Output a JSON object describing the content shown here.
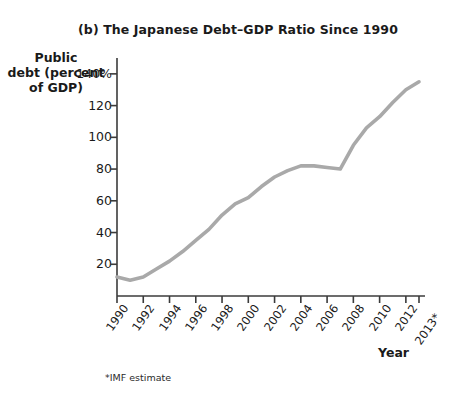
{
  "chart_data": {
    "type": "line",
    "title": "(b) The Japanese Debt–GDP Ratio Since 1990",
    "xlabel": "Year",
    "ylabel": "Public debt (percent of GDP)",
    "ylabel_lines": [
      "Public",
      "debt (percent",
      "of GDP)"
    ],
    "footnote": "*IMF estimate",
    "grid": false,
    "legend": "none",
    "line_color": "#a9a9a9",
    "axis_color": "#3b3b3b",
    "ylim": [
      0,
      150
    ],
    "xlim": [
      1990,
      2013
    ],
    "ytick_values": [
      140,
      120,
      100,
      80,
      60,
      40,
      20
    ],
    "ytick_labels": [
      "140%",
      "120",
      "100",
      "80",
      "60",
      "40",
      "20"
    ],
    "xtick_labels": [
      "1990",
      "1992",
      "1994",
      "1996",
      "1998",
      "2000",
      "2002",
      "2004",
      "2006",
      "2008",
      "2010",
      "2012",
      "2013*"
    ],
    "xtick_values": [
      1990,
      1992,
      1994,
      1996,
      1998,
      2000,
      2002,
      2004,
      2006,
      2008,
      2010,
      2012,
      2013
    ],
    "x": [
      1990,
      1991,
      1992,
      1993,
      1994,
      1995,
      1996,
      1997,
      1998,
      1999,
      2000,
      2001,
      2002,
      2003,
      2004,
      2005,
      2006,
      2007,
      2008,
      2009,
      2010,
      2011,
      2012,
      2013
    ],
    "values": [
      12,
      10,
      12,
      17,
      22,
      28,
      35,
      42,
      51,
      58,
      62,
      69,
      75,
      79,
      82,
      82,
      81,
      80,
      95,
      106,
      113,
      122,
      130,
      135
    ],
    "series_name": "Japanese public debt (percent of GDP)"
  }
}
